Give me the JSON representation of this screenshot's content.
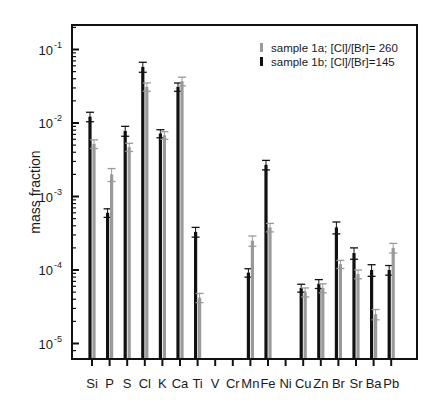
{
  "chart_data": {
    "type": "bar",
    "title": "",
    "xlabel": "",
    "ylabel": "mass fraction",
    "yscale": "log",
    "ylim": [
      6.5e-06,
      0.22
    ],
    "yticks": [
      {
        "exp": "-1",
        "value": 0.1
      },
      {
        "exp": "-2",
        "value": 0.01
      },
      {
        "exp": "-3",
        "value": 0.001
      },
      {
        "exp": "-4",
        "value": 0.0001
      },
      {
        "exp": "-5",
        "value": 1e-05
      }
    ],
    "categories": [
      "Si",
      "P",
      "S",
      "Cl",
      "K",
      "Ca",
      "Ti",
      "V",
      "Cr",
      "Mn",
      "Fe",
      "Ni",
      "Cu",
      "Zn",
      "Br",
      "Sr",
      "Ba",
      "Pb"
    ],
    "legend": {
      "position": "upper right"
    },
    "series": [
      {
        "name": "sample 1a; [Cl]/[Br]= 260",
        "color": "#9a9a9a",
        "values": [
          0.0052,
          0.002,
          0.0047,
          0.031,
          0.0068,
          0.037,
          4.2e-05,
          null,
          null,
          0.00025,
          0.00038,
          null,
          5e-05,
          5.7e-05,
          0.00012,
          8.8e-05,
          2.5e-05,
          0.0002
        ],
        "errors": [
          0.0007,
          0.0004,
          0.0006,
          0.004,
          0.0008,
          0.005,
          6e-06,
          null,
          null,
          4e-05,
          5e-05,
          null,
          7e-06,
          8e-06,
          1.5e-05,
          1.2e-05,
          4e-06,
          3e-05
        ]
      },
      {
        "name": "sample 1b; [Cl]/[Br]=145",
        "color": "#111111",
        "values": [
          0.0122,
          0.0006,
          0.0078,
          0.058,
          0.0072,
          0.031,
          0.00033,
          null,
          null,
          9.2e-05,
          0.0027,
          null,
          5.7e-05,
          6.5e-05,
          0.00038,
          0.00017,
          0.0001,
          0.0001
        ],
        "errors": [
          0.0018,
          8e-05,
          0.0012,
          0.009,
          0.0009,
          0.004,
          5e-05,
          null,
          null,
          1.2e-05,
          0.0004,
          null,
          7e-06,
          9e-06,
          7e-05,
          3e-05,
          1.8e-05,
          1.5e-05
        ]
      }
    ]
  }
}
